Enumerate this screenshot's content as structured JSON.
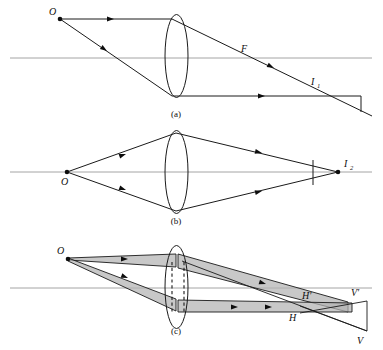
{
  "figure": {
    "background_color": "#ffffff",
    "ink_color": "#1a1a1a",
    "axis_color": "#8d8d8d",
    "beam_shade_color": "#b3b3b3",
    "width": 383,
    "height": 350
  },
  "panels": [
    {
      "id": "a",
      "caption": "(a)",
      "caption_x": 176,
      "caption_y": 115,
      "axis": {
        "y": 58,
        "x1": 10,
        "x2": 372
      },
      "lens": {
        "cx": 176.5,
        "cy": 56,
        "rx": 11.5,
        "ry": 41.5
      },
      "points": [
        {
          "name": "O",
          "label": "O",
          "x": 60,
          "y": 19,
          "label_x": 50,
          "label_y": 14,
          "dot": true
        },
        {
          "name": "F",
          "label": "F",
          "x": 245,
          "y": 58,
          "label_x": 242,
          "label_y": 51,
          "dot": false
        },
        {
          "name": "I1",
          "label": "I",
          "sub": "1",
          "x": 315,
          "y": 88,
          "label_x": 313,
          "label_y": 84,
          "dot": false
        }
      ],
      "rays": [
        {
          "name": "incident-parallel-ray",
          "from": [
            60,
            19
          ],
          "to": [
            172,
            19
          ]
        },
        {
          "name": "refracted-through-focus-ray",
          "from": [
            172,
            19
          ],
          "to": [
            372,
            116
          ]
        },
        {
          "name": "incident-oblique-ray",
          "from": [
            60,
            19
          ],
          "to": [
            172,
            96
          ]
        },
        {
          "name": "refracted-horizontal-ray",
          "from": [
            172,
            96
          ],
          "to": [
            361,
            96
          ]
        },
        {
          "name": "image-plane-segment",
          "from": [
            361,
            96
          ],
          "to": [
            361,
            112
          ]
        }
      ],
      "arrow_marks": [
        {
          "name": "arrow-incident-parallel",
          "x": 114,
          "y": 19,
          "angle": 0
        },
        {
          "name": "arrow-incident-oblique",
          "x": 105,
          "y": 50,
          "angle": 34.5
        },
        {
          "name": "arrow-refracted-focus",
          "x": 272,
          "y": 72,
          "angle": 25.9
        },
        {
          "name": "arrow-refracted-horizontal",
          "x": 262,
          "y": 96,
          "angle": 0
        }
      ]
    },
    {
      "id": "b",
      "caption": "(b)",
      "caption_x": 176,
      "caption_y": 222,
      "axis": {
        "y": 172,
        "x1": 10,
        "x2": 372
      },
      "lens": {
        "cx": 176.5,
        "cy": 172,
        "rx": 11.5,
        "ry": 41.5
      },
      "points": [
        {
          "name": "O",
          "label": "O",
          "x": 67,
          "y": 172,
          "label_x": 61,
          "label_y": 184,
          "dot": true
        },
        {
          "name": "I2",
          "label": "I",
          "sub": "2",
          "x": 338,
          "y": 172,
          "label_x": 344,
          "label_y": 166,
          "dot": true
        }
      ],
      "rays": [
        {
          "name": "upper-incident-ray",
          "from": [
            67,
            172
          ],
          "to": [
            176,
            133
          ]
        },
        {
          "name": "upper-refracted-ray",
          "from": [
            176,
            133
          ],
          "to": [
            338,
            172
          ]
        },
        {
          "name": "lower-incident-ray",
          "from": [
            67,
            172
          ],
          "to": [
            176,
            211
          ]
        },
        {
          "name": "lower-refracted-ray",
          "from": [
            176,
            211
          ],
          "to": [
            338,
            172
          ]
        },
        {
          "name": "image-plane-segment",
          "from": [
            313,
            160
          ],
          "to": [
            313,
            185
          ]
        }
      ],
      "arrow_marks": [
        {
          "name": "arrow-upper-incident",
          "x": 124,
          "y": 153,
          "angle": -19.7
        },
        {
          "name": "arrow-lower-incident",
          "x": 124,
          "y": 191,
          "angle": 19.7
        },
        {
          "name": "arrow-upper-refracted",
          "x": 257,
          "y": 152,
          "angle": 13.5
        },
        {
          "name": "arrow-lower-refracted",
          "x": 257,
          "y": 192,
          "angle": -13.5
        }
      ]
    },
    {
      "id": "c",
      "caption": "(c)",
      "caption_x": 176,
      "caption_y": 332,
      "axis": {
        "y": 288,
        "x1": 10,
        "x2": 372
      },
      "lens": {
        "cx": 176.5,
        "cy": 287,
        "rx": 11.5,
        "ry": 41.5
      },
      "stop": {
        "x1": 172,
        "x2": 184,
        "y1": 262,
        "y2": 312
      },
      "points": [
        {
          "name": "O",
          "label": "O",
          "x": 68,
          "y": 258,
          "label_x": 58,
          "label_y": 253,
          "dot": true
        },
        {
          "name": "H-prime",
          "label": "H′",
          "x": 312,
          "y": 305,
          "label_x": 304,
          "label_y": 300,
          "dot": false
        },
        {
          "name": "H",
          "label": "H",
          "x": 300,
          "y": 313,
          "label_x": 291,
          "label_y": 320,
          "dot": false
        },
        {
          "name": "V-prime",
          "label": "V′",
          "x": 360,
          "y": 303,
          "label_x": 353,
          "label_y": 297,
          "dot": false
        },
        {
          "name": "V",
          "label": "V",
          "x": 362,
          "y": 333,
          "label_x": 358,
          "label_y": 343,
          "dot": false
        }
      ],
      "beams": [
        {
          "name": "upper-beam-incident",
          "points": "68,258 172,256 172,268 68,260"
        },
        {
          "name": "upper-beam-refracted",
          "points": "182,255 182,270 346,311 346,301"
        },
        {
          "name": "lower-beam-incident",
          "points": "68,258 172,300 172,312 68,261"
        },
        {
          "name": "lower-beam-refracted",
          "points": "182,302 182,313 350,313 350,303"
        }
      ],
      "rays": [
        {
          "name": "image-plane-upper",
          "from": [
            353,
            305
          ],
          "to": [
            367,
            301
          ]
        },
        {
          "name": "image-plane-top",
          "from": [
            300,
            313
          ],
          "to": [
            367,
            301
          ]
        },
        {
          "name": "image-plane-right-edge",
          "from": [
            367,
            301
          ],
          "to": [
            367,
            331
          ]
        },
        {
          "name": "image-plane-bottom",
          "from": [
            367,
            331
          ],
          "to": [
            300,
            305
          ]
        },
        {
          "name": "oblique-image-ray",
          "from": [
            182,
            262
          ],
          "to": [
            367,
            331
          ]
        }
      ],
      "arrow_marks": [
        {
          "name": "arrow-upper-incident-c",
          "x": 124,
          "y": 259,
          "angle": 0
        },
        {
          "name": "arrow-lower-incident-c",
          "x": 124,
          "y": 277,
          "angle": 21.5
        },
        {
          "name": "arrow-upper-refracted-c",
          "x": 262,
          "y": 283,
          "angle": 17.0
        },
        {
          "name": "arrow-lower-refracted-c",
          "x": 235,
          "y": 307,
          "angle": 0
        },
        {
          "name": "arrow-lower-refracted-c2",
          "x": 268,
          "y": 307,
          "angle": 0
        }
      ]
    }
  ],
  "labels": {
    "object_point": "O",
    "focal_point": "F",
    "image_one": "I",
    "image_one_sub": "1",
    "image_two": "I",
    "image_two_sub": "2",
    "principal_h": "H",
    "principal_h_prime": "H′",
    "vertex_v": "V",
    "vertex_v_prime": "V′",
    "caption_a": "(a)",
    "caption_b": "(b)",
    "caption_c": "(c)"
  }
}
